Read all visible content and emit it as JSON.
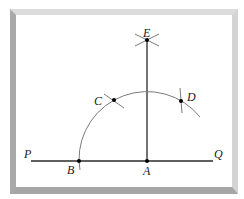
{
  "diagram": {
    "type": "geometric-construction",
    "colors": {
      "line": "#2a2a2a",
      "arc": "#7a7a7a",
      "point": "#000000",
      "frame_top": "#dcdcdc",
      "frame_left": "#a9a9a9",
      "frame_right": "#d4d4d4",
      "frame_bottom": "#a6a6a6"
    },
    "labels": {
      "P": "P",
      "Q": "Q",
      "A": "A",
      "B": "B",
      "C": "C",
      "D": "D",
      "E": "E"
    },
    "points": [
      {
        "name": "A",
        "x": 147,
        "y": 161
      },
      {
        "name": "B",
        "x": 79,
        "y": 161
      },
      {
        "name": "C",
        "x": 114,
        "y": 100
      },
      {
        "name": "D",
        "x": 181,
        "y": 101
      },
      {
        "name": "E",
        "x": 147,
        "y": 40
      }
    ],
    "segments": [
      {
        "name": "line-PQ",
        "from": "P",
        "to": "Q"
      },
      {
        "name": "segment-AE",
        "from": "A",
        "to": "E"
      }
    ],
    "arcs": [
      {
        "name": "arc-BCD",
        "center": "A",
        "radius": 68
      }
    ]
  }
}
